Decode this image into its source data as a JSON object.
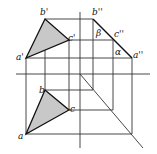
{
  "diagram": {
    "type": "orthographic-projection",
    "front_view": {
      "points": {
        "a'": {
          "label": "a'",
          "x": 26,
          "y": 58
        },
        "b'": {
          "label": "b'",
          "x": 45,
          "y": 19
        },
        "c'": {
          "label": "c'",
          "x": 69,
          "y": 40
        }
      }
    },
    "side_view": {
      "points": {
        "b''": {
          "label": "b''",
          "x": 93,
          "y": 19
        },
        "c''": {
          "label": "c''",
          "x": 113,
          "y": 40
        },
        "a''": {
          "label": "a''",
          "x": 132,
          "y": 58
        }
      },
      "angles": {
        "beta": "β",
        "alpha": "α"
      }
    },
    "top_view": {
      "points": {
        "a": {
          "label": "a",
          "x": 26,
          "y": 134
        },
        "b": {
          "label": "b",
          "x": 45,
          "y": 90
        },
        "c": {
          "label": "c",
          "x": 69,
          "y": 110
        }
      }
    },
    "colors": {
      "fill": "#c8c8c8",
      "line": "#333333"
    }
  }
}
